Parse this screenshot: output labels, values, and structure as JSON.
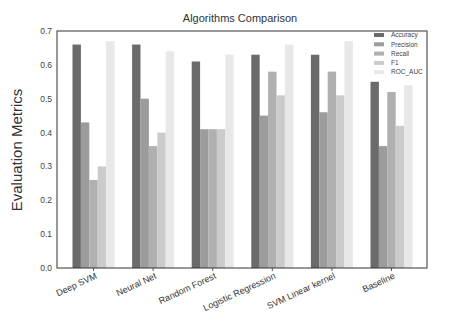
{
  "chart_data": {
    "type": "bar",
    "title": "Algorithms Comparison",
    "xlabel": "",
    "ylabel": "Evaluation Metrics",
    "ylim": [
      0.0,
      0.7
    ],
    "yticks": [
      "0.0",
      "0.1",
      "0.2",
      "0.3",
      "0.4",
      "0.5",
      "0.6",
      "0.7"
    ],
    "grid": false,
    "legend_position": "upper right",
    "categories": [
      "Deep SVM",
      "Neural Net",
      "Random Forest",
      "Logistic Regression",
      "SVM Linear kernel",
      "Baseline"
    ],
    "series": [
      {
        "name": "Accuracy",
        "color": "#6b6b6b",
        "values": [
          0.66,
          0.66,
          0.61,
          0.63,
          0.63,
          0.55
        ]
      },
      {
        "name": "Precision",
        "color": "#9c9c9c",
        "values": [
          0.43,
          0.5,
          0.41,
          0.45,
          0.46,
          0.36
        ]
      },
      {
        "name": "Recall",
        "color": "#b0b0b0",
        "values": [
          0.26,
          0.36,
          0.41,
          0.58,
          0.58,
          0.52
        ]
      },
      {
        "name": "F1",
        "color": "#cbcbcb",
        "values": [
          0.3,
          0.4,
          0.41,
          0.51,
          0.51,
          0.42
        ]
      },
      {
        "name": "ROC_AUC",
        "color": "#e8e8e8",
        "values": [
          0.67,
          0.64,
          0.63,
          0.66,
          0.67,
          0.54
        ]
      }
    ]
  }
}
